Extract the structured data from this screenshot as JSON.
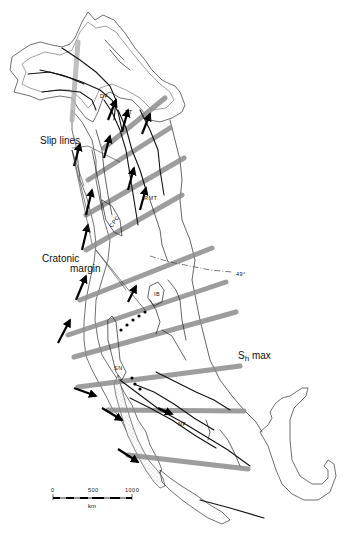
{
  "figure": {
    "type": "tectonic map",
    "region": "western North America",
    "colors": {
      "stress_band": "#8c8c8c",
      "fault": "#111111",
      "shelf_stipple": "#e9e9e9",
      "background": "#ffffff"
    }
  },
  "labels": {
    "slip_lines": "Slip lines",
    "cratonic_margin": "Cratonic margin",
    "cratonic_margin_line1": "Cratonic",
    "cratonic_margin_line2": "margin",
    "sh_max_s": "S",
    "sh_max_sub": "h",
    "sh_max_rest": " max",
    "latitude": "49°",
    "fault_abbreviations": {
      "df": "DF",
      "tt": "TT",
      "rmt": "RMT",
      "cpc": "CPC",
      "ib": "IB",
      "sn": "SN",
      "nf": "NF"
    }
  },
  "scale_bar": {
    "ticks": [
      "0",
      "500",
      "1000"
    ],
    "unit": "km"
  },
  "legend_items": [
    {
      "symbol": "black-arrow",
      "meaning": "Slip lines"
    },
    {
      "symbol": "gray-band",
      "meaning": "Sh max"
    },
    {
      "symbol": "leader-lines",
      "meaning": "Cratonic margin"
    }
  ]
}
